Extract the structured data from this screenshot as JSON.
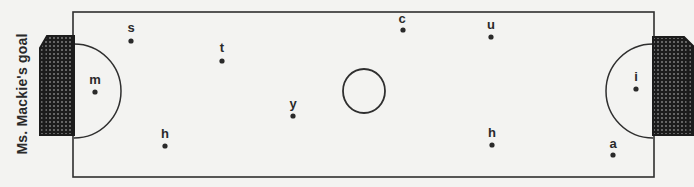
{
  "diagram": {
    "goal_label": "Ms. Mackie's goal",
    "colors": {
      "background": "#f3f3f1",
      "line": "#2f2f2f",
      "net": "#1c1c1c",
      "marker": "#2a2a2a"
    },
    "players": [
      {
        "label": "s",
        "side": "left-half",
        "zone": "top"
      },
      {
        "label": "t",
        "side": "left-half",
        "zone": "upper-middle"
      },
      {
        "label": "m",
        "side": "left-half",
        "zone": "inside left circle"
      },
      {
        "label": "h",
        "side": "left-half",
        "zone": "bottom"
      },
      {
        "label": "y",
        "side": "left-half",
        "zone": "near center, lower"
      },
      {
        "label": "c",
        "side": "right-half",
        "zone": "top"
      },
      {
        "label": "u",
        "side": "right-half",
        "zone": "top"
      },
      {
        "label": "h",
        "side": "right-half",
        "zone": "bottom"
      },
      {
        "label": "i",
        "side": "right-half",
        "zone": "inside right circle"
      },
      {
        "label": "a",
        "side": "right-half",
        "zone": "bottom corner"
      }
    ]
  }
}
